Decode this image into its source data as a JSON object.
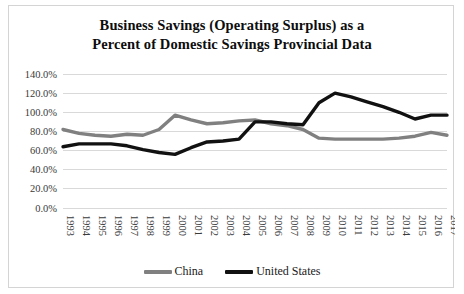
{
  "chart_data": {
    "type": "line",
    "title_line1": "Business Savings (Operating Surplus) as a",
    "title_line2": "Percent of Domestic Savings Provincial Data",
    "xlabel": "",
    "ylabel": "",
    "ylim": [
      0,
      140
    ],
    "ytick_values": [
      0,
      20,
      40,
      60,
      80,
      100,
      120,
      140
    ],
    "ytick_labels": [
      "0.0%",
      "20.0%",
      "40.0%",
      "60.0%",
      "80.0%",
      "100.0%",
      "120.0%",
      "140.0%"
    ],
    "grid": true,
    "legend_position": "bottom",
    "categories": [
      "1993",
      "1994",
      "1995",
      "1996",
      "1997",
      "1998",
      "1999",
      "2000",
      "2001",
      "2002",
      "2003",
      "2004",
      "2005",
      "2006",
      "2007",
      "2008",
      "2009",
      "2010",
      "2011",
      "2012",
      "2013",
      "2014",
      "2015",
      "2016",
      "2017"
    ],
    "series": [
      {
        "name": "China",
        "color": "#808080",
        "values": [
          82.0,
          78.0,
          76.0,
          75.0,
          77.0,
          76.0,
          82.0,
          97.0,
          92.0,
          88.0,
          89.0,
          91.0,
          92.0,
          88.0,
          86.0,
          82.0,
          73.0,
          72.0,
          72.0,
          72.0,
          72.0,
          73.0,
          75.0,
          79.0,
          76.0
        ]
      },
      {
        "name": "United States",
        "color": "#111111",
        "values": [
          64.0,
          67.0,
          67.0,
          67.0,
          65.0,
          61.0,
          58.0,
          56.0,
          63.0,
          69.0,
          70.0,
          72.0,
          90.0,
          90.0,
          88.0,
          87.0,
          110.0,
          120.0,
          116.0,
          111.0,
          106.0,
          100.0,
          93.0,
          97.0,
          97.0
        ]
      }
    ]
  }
}
